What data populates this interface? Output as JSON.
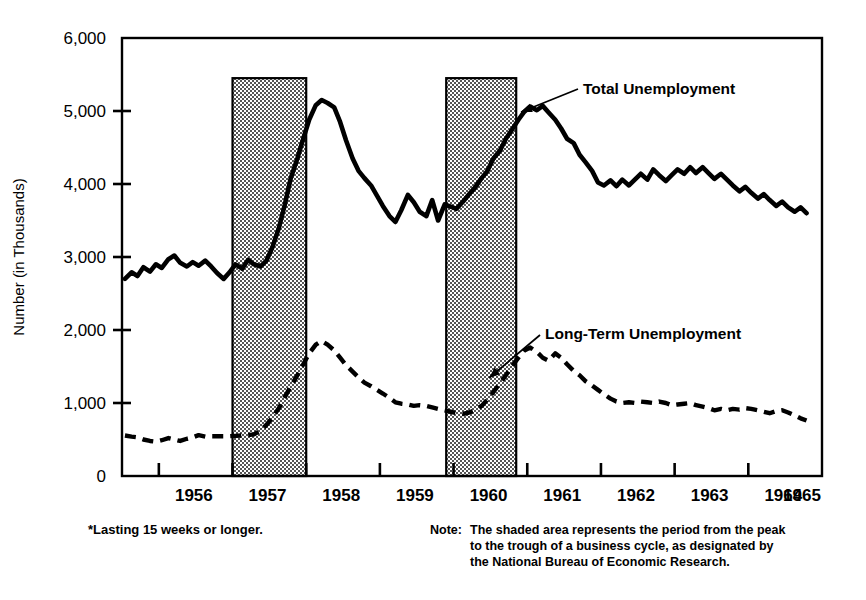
{
  "chart_data": {
    "type": "line",
    "title": "",
    "subtitle": "",
    "xlabel": "",
    "ylabel": "Number (in Thousands)",
    "xlim": [
      1955.5,
      1965.0
    ],
    "ylim": [
      0,
      6000
    ],
    "grid": false,
    "legend_position": "inline-annotations",
    "y_ticks": [
      "0",
      "1,000",
      "2,000",
      "3,000",
      "4,000",
      "5,000",
      "6,000"
    ],
    "y_tick_values": [
      0,
      1000,
      2000,
      3000,
      4000,
      5000,
      6000
    ],
    "x_ticks": [
      "1956",
      "1957",
      "1958",
      "1959",
      "1960",
      "1961",
      "1962",
      "1963",
      "1964",
      "1965"
    ],
    "x_tick_values": [
      1956,
      1957,
      1958,
      1959,
      1960,
      1961,
      1962,
      1963,
      1964,
      1965
    ],
    "shaded_bands": [
      {
        "name": "recession-1957-1958",
        "start": 1957.0,
        "end": 1958.0,
        "top_value": 5450
      },
      {
        "name": "recession-1960-1961",
        "start": 1959.9,
        "end": 1960.85,
        "top_value": 5450
      }
    ],
    "series": [
      {
        "name": "Total Unemployment",
        "style": "solid",
        "color": "#000000",
        "annotation": "Total Unemployment",
        "x": [
          1955.54,
          1955.63,
          1955.71,
          1955.79,
          1955.88,
          1955.96,
          1956.04,
          1956.13,
          1956.21,
          1956.29,
          1956.38,
          1956.46,
          1956.54,
          1956.63,
          1956.71,
          1956.79,
          1956.88,
          1956.96,
          1957.04,
          1957.13,
          1957.21,
          1957.29,
          1957.38,
          1957.46,
          1957.54,
          1957.63,
          1957.71,
          1957.79,
          1957.88,
          1957.96,
          1958.04,
          1958.13,
          1958.21,
          1958.29,
          1958.38,
          1958.46,
          1958.54,
          1958.63,
          1958.71,
          1958.79,
          1958.88,
          1958.96,
          1959.04,
          1959.13,
          1959.21,
          1959.29,
          1959.38,
          1959.46,
          1959.54,
          1959.63,
          1959.71,
          1959.79,
          1959.88,
          1959.96,
          1960.04,
          1960.13,
          1960.21,
          1960.29,
          1960.38,
          1960.46,
          1960.54,
          1960.63,
          1960.71,
          1960.79,
          1960.88,
          1960.96,
          1961.04,
          1961.13,
          1961.21,
          1961.29,
          1961.38,
          1961.46,
          1961.54,
          1961.63,
          1961.71,
          1961.79,
          1961.88,
          1961.96,
          1962.04,
          1962.13,
          1962.21,
          1962.29,
          1962.38,
          1962.46,
          1962.54,
          1962.63,
          1962.71,
          1962.79,
          1962.88,
          1962.96,
          1963.04,
          1963.13,
          1963.21,
          1963.29,
          1963.38,
          1963.46,
          1963.54,
          1963.63,
          1963.71,
          1963.79,
          1963.88,
          1963.96,
          1964.04,
          1964.13,
          1964.21,
          1964.29,
          1964.38,
          1964.46,
          1964.54,
          1964.63,
          1964.71,
          1964.79
        ],
        "values": [
          2700,
          2790,
          2740,
          2860,
          2800,
          2900,
          2850,
          2970,
          3020,
          2920,
          2870,
          2930,
          2880,
          2950,
          2870,
          2780,
          2700,
          2790,
          2900,
          2840,
          2960,
          2900,
          2870,
          2950,
          3130,
          3400,
          3720,
          4080,
          4350,
          4620,
          4880,
          5080,
          5150,
          5110,
          5050,
          4850,
          4600,
          4350,
          4180,
          4080,
          3980,
          3840,
          3700,
          3560,
          3480,
          3640,
          3850,
          3750,
          3620,
          3560,
          3780,
          3500,
          3720,
          3690,
          3660,
          3760,
          3860,
          3950,
          4080,
          4180,
          4350,
          4460,
          4620,
          4740,
          4880,
          4990,
          5060,
          5010,
          5070,
          4980,
          4880,
          4760,
          4620,
          4560,
          4400,
          4300,
          4180,
          4020,
          3980,
          4050,
          3970,
          4060,
          3980,
          4060,
          4140,
          4060,
          4200,
          4120,
          4040,
          4120,
          4200,
          4140,
          4230,
          4150,
          4230,
          4150,
          4070,
          4140,
          4060,
          3980,
          3900,
          3960,
          3880,
          3800,
          3860,
          3780,
          3700,
          3760,
          3680,
          3620,
          3680,
          3600
        ]
      },
      {
        "name": "Long-Term Unemployment",
        "style": "dashed",
        "color": "#000000",
        "annotation": "Long-Term Unemployment",
        "footnote_ref": "*Lasting 15 weeks or longer.",
        "x": [
          1955.54,
          1955.63,
          1955.71,
          1955.79,
          1955.88,
          1955.96,
          1956.04,
          1956.13,
          1956.21,
          1956.29,
          1956.38,
          1956.46,
          1956.54,
          1956.63,
          1956.71,
          1956.79,
          1956.88,
          1956.96,
          1957.04,
          1957.13,
          1957.21,
          1957.29,
          1957.38,
          1957.46,
          1957.54,
          1957.63,
          1957.71,
          1957.79,
          1957.88,
          1957.96,
          1958.04,
          1958.13,
          1958.21,
          1958.29,
          1958.38,
          1958.46,
          1958.54,
          1958.63,
          1958.71,
          1958.79,
          1958.88,
          1958.96,
          1959.04,
          1959.13,
          1959.21,
          1959.29,
          1959.38,
          1959.46,
          1959.54,
          1959.63,
          1959.71,
          1959.79,
          1959.88,
          1959.96,
          1960.04,
          1960.13,
          1960.21,
          1960.29,
          1960.38,
          1960.46,
          1960.54,
          1960.63,
          1960.71,
          1960.79,
          1960.88,
          1960.96,
          1961.04,
          1961.13,
          1961.21,
          1961.29,
          1961.38,
          1961.46,
          1961.54,
          1961.63,
          1961.71,
          1961.79,
          1961.88,
          1961.96,
          1962.04,
          1962.13,
          1962.21,
          1962.29,
          1962.38,
          1962.46,
          1962.54,
          1962.63,
          1962.71,
          1962.79,
          1962.88,
          1962.96,
          1963.04,
          1963.13,
          1963.21,
          1963.29,
          1963.38,
          1963.46,
          1963.54,
          1963.63,
          1963.71,
          1963.79,
          1963.88,
          1963.96,
          1964.04,
          1964.13,
          1964.21,
          1964.29,
          1964.38,
          1964.46,
          1964.54,
          1964.63,
          1964.71,
          1964.79
        ],
        "values": [
          555,
          540,
          530,
          500,
          480,
          470,
          490,
          520,
          500,
          480,
          510,
          530,
          560,
          540,
          545,
          545,
          545,
          545,
          550,
          555,
          560,
          570,
          620,
          700,
          800,
          930,
          1080,
          1230,
          1380,
          1530,
          1680,
          1800,
          1850,
          1800,
          1720,
          1620,
          1520,
          1430,
          1350,
          1280,
          1230,
          1180,
          1130,
          1070,
          1010,
          990,
          980,
          960,
          970,
          960,
          940,
          920,
          900,
          880,
          860,
          850,
          870,
          900,
          960,
          1050,
          1150,
          1270,
          1380,
          1500,
          1620,
          1720,
          1760,
          1700,
          1620,
          1580,
          1680,
          1620,
          1530,
          1440,
          1380,
          1300,
          1240,
          1180,
          1120,
          1060,
          1020,
          1000,
          1010,
          1000,
          1020,
          1010,
          1000,
          1020,
          1000,
          970,
          980,
          990,
          1000,
          970,
          950,
          930,
          900,
          920,
          900,
          920,
          910,
          930,
          920,
          900,
          880,
          860,
          890,
          900,
          870,
          830,
          790,
          760
        ]
      }
    ],
    "annotations": [
      {
        "name": "total-unemployment-label",
        "text": "Total Unemployment",
        "x": 1961.6,
        "y": 5150
      },
      {
        "name": "long-term-unemployment-label",
        "text": "Long-Term Unemployment",
        "x": 1961.2,
        "y": 2000
      }
    ]
  },
  "footnote": {
    "left": "*Lasting 15 weeks or longer.",
    "note_prefix": "Note:",
    "note_line1": "The shaded area represents the period from the peak",
    "note_line2": "to the trough of a business cycle, as designated by",
    "note_line3": "the National Bureau of Economic Research."
  },
  "colors": {
    "line": "#000000",
    "axis": "#000000",
    "shade_fill": "#cccccc",
    "background": "#ffffff"
  }
}
